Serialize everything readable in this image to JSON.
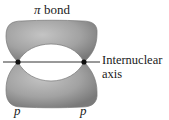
{
  "diagram": {
    "title_symbol": "π",
    "title_text": " bond",
    "axis_label_line1": "Internuclear",
    "axis_label_line2": "axis",
    "orbital_left_label": "p",
    "orbital_right_label": "p",
    "lobe_color": "#9a9a9a",
    "nucleus_color": "#111111"
  }
}
